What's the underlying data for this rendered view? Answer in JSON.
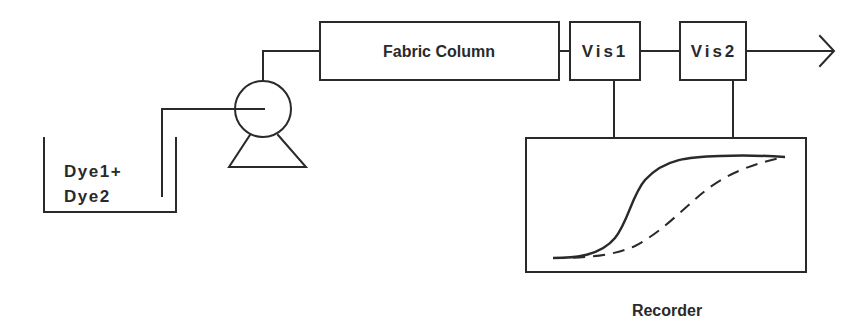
{
  "diagram": {
    "type": "flow-schematic",
    "reservoir": {
      "label_line1": "Dye1+",
      "label_line2": "Dye2"
    },
    "pump": {
      "label": ""
    },
    "column": {
      "label": "Fabric Column"
    },
    "detector1": {
      "label": "Vis1"
    },
    "detector2": {
      "label": "Vis2"
    },
    "recorder": {
      "label": "Recorder",
      "traces": [
        {
          "name": "Vis1 trace",
          "style": "solid"
        },
        {
          "name": "Vis2 trace",
          "style": "dashed"
        }
      ]
    },
    "outlet": {
      "label": ""
    },
    "colors": {
      "line": "#2a2a2a",
      "background": "#ffffff"
    }
  }
}
